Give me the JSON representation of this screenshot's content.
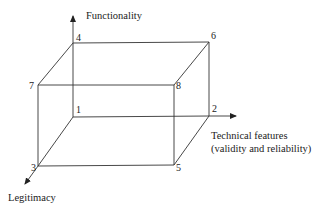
{
  "diagram": {
    "type": "3d-box-axes",
    "axes": {
      "vertical": {
        "label": "Functionality"
      },
      "horizontal": {
        "label_line1": "Technical features",
        "label_line2": "(validity and reliability)"
      },
      "depth": {
        "label": "Legitimacy"
      }
    },
    "vertices": {
      "v1": {
        "label": "1"
      },
      "v2": {
        "label": "2"
      },
      "v3": {
        "label": "3"
      },
      "v4": {
        "label": "4"
      },
      "v5": {
        "label": "5"
      },
      "v6": {
        "label": "6"
      },
      "v7": {
        "label": "7"
      },
      "v8": {
        "label": "8"
      }
    },
    "line_color": "#333333"
  }
}
